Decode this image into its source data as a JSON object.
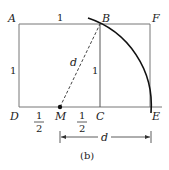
{
  "figure": {
    "caption": "(b)",
    "points": {
      "A": "A",
      "B": "B",
      "F": "F",
      "D": "D",
      "M": "M",
      "C": "C",
      "E": "E"
    },
    "labels": {
      "top_side": "1",
      "left_side": "1",
      "bc_side": "1",
      "diagonal": "d",
      "dm_num": "1",
      "dm_den": "2",
      "mc_num": "1",
      "mc_den": "2",
      "dimension": "d"
    }
  }
}
